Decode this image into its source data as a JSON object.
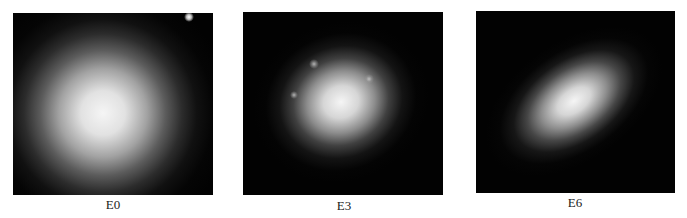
{
  "figure": {
    "panels": [
      {
        "label": "E0",
        "description": "Nearly circular elliptical galaxy",
        "ellipticity_class": 0
      },
      {
        "label": "E3",
        "description": "Moderately elongated elliptical galaxy with foreground stars",
        "ellipticity_class": 3
      },
      {
        "label": "E6",
        "description": "Strongly elongated elliptical galaxy",
        "ellipticity_class": 6
      }
    ]
  },
  "colors": {
    "panel_background": "#020202",
    "galaxy_core": "#f5f5f5",
    "caption_text": "#1a1a1a",
    "page_background": "#ffffff"
  }
}
